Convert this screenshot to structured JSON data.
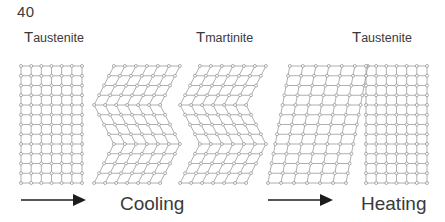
{
  "figure": {
    "page_number": "40",
    "background_color": "#ffffff",
    "lattice_line_color": "#9a9a9a",
    "lattice_node_fill": "#ffffff",
    "lattice_node_stroke": "#8c8c8c",
    "arrow_color": "#1c1c1c",
    "text_color": "#3a3a3a"
  },
  "temperature_labels": [
    {
      "prefix": "T",
      "subscript": "austenite",
      "full": "Taustenite"
    },
    {
      "prefix": "T",
      "subscript": "martinite",
      "full": "Tmartinite"
    },
    {
      "prefix": "T",
      "subscript": "austenite",
      "full": "Taustenite"
    }
  ],
  "process_labels": {
    "cooling": "Cooling",
    "heating": "Heating"
  },
  "arrows": [
    {
      "name": "cooling-arrow",
      "direction": "right"
    },
    {
      "name": "heating-arrow",
      "direction": "right"
    }
  ],
  "lattices": [
    {
      "name": "austenite-cubic-lattice-left",
      "phase": "austenite",
      "shape": "square",
      "columns": 7,
      "rows": 13,
      "x": 21,
      "y": 66,
      "width": 61,
      "height": 117
    },
    {
      "name": "twinned-martensite-lattice-1",
      "phase": "martensite",
      "shape": "twinned-zigzag",
      "columns": 7,
      "rows": 13,
      "x": 104,
      "y": 66,
      "width": 66,
      "height": 117
    },
    {
      "name": "twinned-martensite-lattice-2",
      "phase": "martensite",
      "shape": "twinned-zigzag",
      "columns": 7,
      "rows": 13,
      "x": 190,
      "y": 66,
      "width": 66,
      "height": 117
    },
    {
      "name": "detwinned-martensite-lattice",
      "phase": "martensite",
      "shape": "sheared-parallelogram",
      "columns": 7,
      "rows": 13,
      "x": 268,
      "y": 66,
      "width": 78,
      "height": 117
    },
    {
      "name": "austenite-cubic-lattice-right",
      "phase": "austenite",
      "shape": "square",
      "columns": 7,
      "rows": 13,
      "x": 366,
      "y": 66,
      "width": 61,
      "height": 117
    }
  ]
}
